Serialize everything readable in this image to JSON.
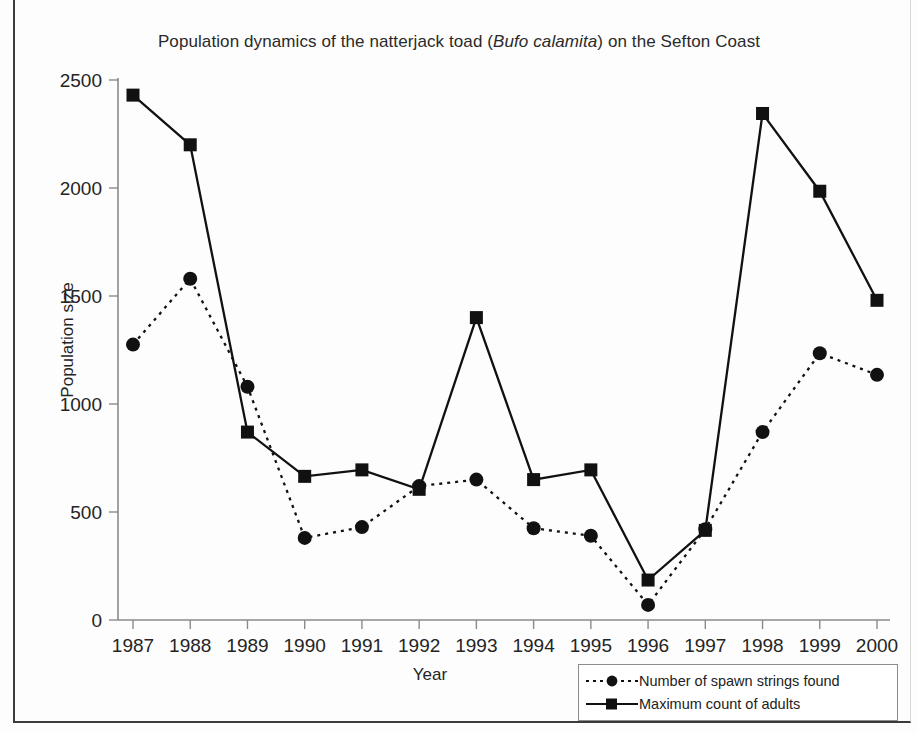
{
  "figure": {
    "title_before": "Population dynamics of the natterjack toad (",
    "title_species": "Bufo calamita",
    "title_after": ") on the Sefton Coast"
  },
  "chart_data": {
    "type": "line",
    "title": "Population dynamics of the natterjack toad (Bufo calamita) on the Sefton Coast",
    "xlabel": "Year",
    "ylabel": "Population size",
    "categories": [
      "1987",
      "1988",
      "1989",
      "1990",
      "1991",
      "1992",
      "1993",
      "1994",
      "1995",
      "1996",
      "1997",
      "1998",
      "1999",
      "2000"
    ],
    "xtick_labels": [
      "1987",
      "1988",
      "1989",
      "1990",
      "1991",
      "1992",
      "1993",
      "1994",
      "1995",
      "1996",
      "1997",
      "1998",
      "1999",
      "2000"
    ],
    "ytick_labels": [
      "0",
      "500",
      "1000",
      "1500",
      "2000",
      "2500"
    ],
    "yticks": [
      0,
      500,
      1000,
      1500,
      2000,
      2500
    ],
    "ylim": [
      0,
      2500
    ],
    "grid": false,
    "legend_position": "bottom-right",
    "series": [
      {
        "name": "Number of spawn strings found",
        "marker": "circle",
        "linestyle": "dotted",
        "color": "#111111",
        "values": [
          1275,
          1580,
          1080,
          380,
          430,
          620,
          650,
          425,
          390,
          70,
          420,
          870,
          1235,
          1135
        ]
      },
      {
        "name": "Maximum count of adults",
        "marker": "square",
        "linestyle": "solid",
        "color": "#111111",
        "values": [
          2430,
          2200,
          870,
          665,
          695,
          605,
          1400,
          650,
          695,
          185,
          415,
          2345,
          1985,
          1480
        ]
      }
    ]
  },
  "legend": {
    "items": [
      {
        "label": "Number of spawn strings found"
      },
      {
        "label": "Maximum count of adults"
      }
    ]
  }
}
